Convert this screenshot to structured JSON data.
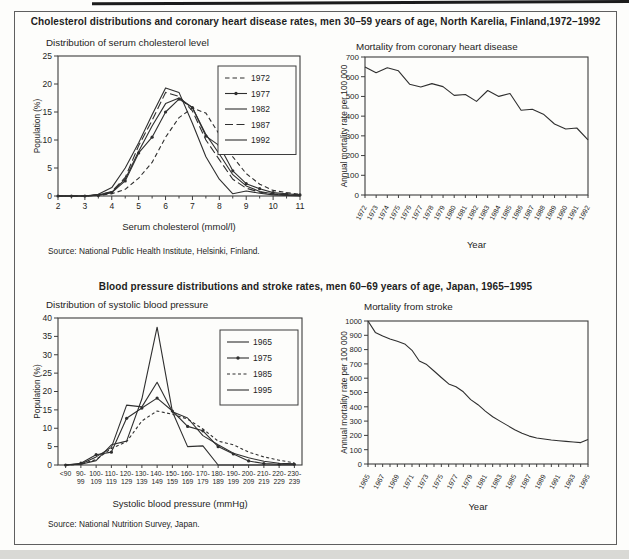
{
  "figure": {
    "panels": [
      {
        "title": "Cholesterol distributions and coronary heart disease rates, men 30–59 years of age, North Karelia, Finland,1972–1992",
        "source": "Source: National Public Health Institute, Helsinki, Finland."
      },
      {
        "title": "Blood pressure distributions and stroke rates, men 60–69 years of age, Japan, 1965–1995",
        "source": "Source: National Nutrition Survey, Japan."
      }
    ],
    "ink_color": "#2f2f2f",
    "axis_color": "#3d3d3d"
  },
  "chart_data": [
    {
      "id": "cholesterol-distribution",
      "type": "line",
      "title": "Distribution of serum cholesterol level",
      "xlabel": "Serum cholesterol (mmol/l)",
      "ylabel": "Population (%)",
      "xlim": [
        2,
        11
      ],
      "ylim": [
        0,
        25
      ],
      "x_ticks": [
        2,
        3,
        4,
        5,
        6,
        7,
        8,
        9,
        10,
        11
      ],
      "y_ticks": [
        0,
        5,
        10,
        15,
        20,
        25
      ],
      "grid": false,
      "legend_position": "top-right",
      "x": [
        2,
        2.5,
        3,
        3.5,
        4,
        4.5,
        5,
        5.5,
        6,
        6.5,
        7,
        7.5,
        8,
        8.5,
        9,
        9.5,
        10,
        10.5,
        11
      ],
      "series": [
        {
          "name": "1972",
          "line_style": "dashed",
          "values": [
            0,
            0,
            0,
            0.1,
            0.4,
            1.2,
            3.2,
            6,
            10.5,
            14,
            15.7,
            14.8,
            11,
            7,
            4,
            2.1,
            1,
            0.6,
            0.3
          ]
        },
        {
          "name": "1977",
          "line_style": "solid-marker",
          "values": [
            0,
            0,
            0,
            0.1,
            0.6,
            2.7,
            7.7,
            10.5,
            15,
            17.3,
            15.8,
            10.7,
            9,
            4.5,
            2.2,
            1.3,
            0.6,
            0.4,
            0.2
          ]
        },
        {
          "name": "1982",
          "line_style": "solid",
          "values": [
            0,
            0,
            0,
            0.2,
            0.7,
            3,
            8,
            12.5,
            16.5,
            17.5,
            15.8,
            11,
            7.5,
            3.8,
            1.8,
            0.8,
            0.4,
            0.2,
            0.1
          ]
        },
        {
          "name": "1987",
          "line_style": "longdash",
          "values": [
            0,
            0,
            0,
            0.2,
            0.8,
            3.3,
            9,
            13.5,
            18.5,
            17.8,
            15.2,
            10,
            6.5,
            3,
            1.4,
            0.7,
            0.3,
            0.2,
            0.1
          ]
        },
        {
          "name": "1992",
          "line_style": "solid",
          "values": [
            0,
            0,
            0,
            0.3,
            1.5,
            5,
            9.5,
            14.5,
            19.3,
            18.5,
            13,
            7,
            3,
            0.4,
            0.9,
            0.5,
            0.2,
            0.1,
            0
          ]
        }
      ]
    },
    {
      "id": "chd-mortality",
      "type": "line",
      "title": "Mortality from coronary heart disease",
      "xlabel": "Year",
      "ylabel": "Annual mortality rate per 100 000",
      "ylim": [
        0,
        700
      ],
      "y_ticks": [
        0,
        100,
        200,
        300,
        400,
        500,
        600,
        700
      ],
      "grid": false,
      "x": [
        1972,
        1973,
        1974,
        1975,
        1976,
        1977,
        1978,
        1979,
        1980,
        1981,
        1982,
        1983,
        1984,
        1985,
        1986,
        1987,
        1988,
        1989,
        1990,
        1991,
        1992
      ],
      "series": [
        {
          "name": "CHD mortality",
          "line_style": "solid",
          "values": [
            650,
            620,
            645,
            630,
            562,
            548,
            565,
            550,
            505,
            510,
            475,
            530,
            500,
            515,
            430,
            435,
            410,
            360,
            335,
            340,
            280
          ]
        }
      ]
    },
    {
      "id": "blood-pressure-distribution",
      "type": "line",
      "title": "Distribution of systolic blood pressure",
      "xlabel": "Systolic blood pressure (mmHg)",
      "ylabel": "Population (%)",
      "ylim": [
        0,
        40
      ],
      "y_ticks": [
        0,
        5,
        10,
        15,
        20,
        25,
        30,
        35,
        40
      ],
      "grid": false,
      "legend_position": "top-right",
      "categories": [
        "<90",
        "90-99",
        "100-109",
        "110-119",
        "120-129",
        "130-139",
        "140-149",
        "150-159",
        "160-169",
        "170-179",
        "180-189",
        "190-199",
        "200-209",
        "210-219",
        "220-229",
        "230-239"
      ],
      "series": [
        {
          "name": "1965",
          "line_style": "solid",
          "values": [
            0,
            0.3,
            2.2,
            4.8,
            16.3,
            15.8,
            22.5,
            14.5,
            12.8,
            8,
            5.5,
            3.2,
            2,
            1,
            0.5,
            0.3
          ]
        },
        {
          "name": "1975",
          "line_style": "solid-marker",
          "values": [
            0,
            0.5,
            2.8,
            3.5,
            12.7,
            15.5,
            18.2,
            14.7,
            10.5,
            9.3,
            5,
            3,
            1.1,
            0.4,
            0.2,
            0.2
          ]
        },
        {
          "name": "1985",
          "line_style": "shortdash",
          "values": [
            0,
            0.2,
            1.5,
            4.5,
            6.3,
            12,
            14.7,
            13.8,
            12.5,
            9.8,
            6.5,
            5.5,
            3.5,
            2.2,
            1.3,
            0.6
          ]
        },
        {
          "name": "1995",
          "line_style": "solid",
          "values": [
            0,
            0.2,
            1.2,
            5.5,
            6.5,
            18,
            37.5,
            14.5,
            5,
            5.2,
            0,
            0,
            0,
            0,
            0,
            0
          ]
        }
      ]
    },
    {
      "id": "stroke-mortality",
      "type": "line",
      "title": "Mortality from stroke",
      "xlabel": "Year",
      "ylabel": "Annual mortality rate per 100 000",
      "ylim": [
        0,
        1000
      ],
      "y_ticks": [
        0,
        100,
        200,
        300,
        400,
        500,
        600,
        700,
        800,
        900,
        1000
      ],
      "grid": false,
      "x": [
        1965,
        1966,
        1967,
        1968,
        1969,
        1970,
        1971,
        1972,
        1973,
        1974,
        1975,
        1976,
        1977,
        1978,
        1979,
        1980,
        1981,
        1982,
        1983,
        1984,
        1985,
        1986,
        1987,
        1988,
        1989,
        1990,
        1991,
        1992,
        1993,
        1994,
        1995
      ],
      "x_label_every": 2,
      "series": [
        {
          "name": "Stroke mortality",
          "line_style": "solid",
          "values": [
            1000,
            920,
            895,
            875,
            858,
            840,
            795,
            720,
            695,
            650,
            605,
            560,
            540,
            505,
            450,
            415,
            370,
            330,
            300,
            270,
            240,
            215,
            195,
            182,
            175,
            168,
            163,
            158,
            154,
            150,
            172
          ]
        }
      ]
    }
  ]
}
